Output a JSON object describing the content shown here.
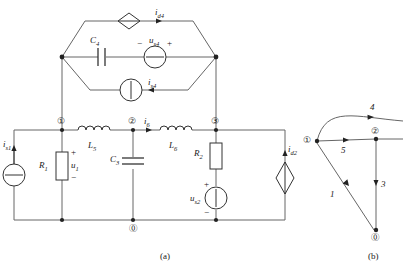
{
  "figure": {
    "captions": [
      {
        "id": "caption-a",
        "text": "(a)",
        "x": 160,
        "y": 252
      },
      {
        "id": "caption-b",
        "text": "(b)",
        "x": 368,
        "y": 252
      }
    ],
    "colors": {
      "wire": "#555555",
      "symbol": "#222222",
      "text": "#1a1a1a",
      "background": "#ffffff"
    }
  },
  "circuit": {
    "components": [
      {
        "name": "current-source-is1",
        "label": "i",
        "sub": "s1",
        "type": "independent-current-source",
        "symbol": "circle-horizontal-bar"
      },
      {
        "name": "resistor-r1",
        "label": "R",
        "sub": "1",
        "type": "resistor",
        "symbol": "rectangle"
      },
      {
        "name": "voltage-u1",
        "label": "u",
        "sub": "1",
        "type": "voltage-label",
        "plus": "+",
        "minus": "−"
      },
      {
        "name": "inductor-l5",
        "label": "L",
        "sub": "5",
        "type": "inductor",
        "symbol": "coil"
      },
      {
        "name": "capacitor-c3",
        "label": "C",
        "sub": "3",
        "type": "capacitor",
        "symbol": "parallel-plates"
      },
      {
        "name": "inductor-l6",
        "label": "L",
        "sub": "6",
        "type": "inductor",
        "symbol": "coil"
      },
      {
        "name": "current-i6",
        "label": "i",
        "sub": "6",
        "type": "branch-current",
        "direction": "right"
      },
      {
        "name": "resistor-r2",
        "label": "R",
        "sub": "2",
        "type": "resistor",
        "symbol": "rectangle"
      },
      {
        "name": "voltage-source-us2",
        "label": "u",
        "sub": "s2",
        "type": "independent-voltage-source",
        "symbol": "circle-vertical-bar",
        "plus": "+",
        "minus": "−"
      },
      {
        "name": "controlled-source-id2",
        "label": "i",
        "sub": "d2",
        "type": "controlled-current-source",
        "symbol": "diamond",
        "direction": "up"
      },
      {
        "name": "capacitor-c4",
        "label": "C",
        "sub": "4",
        "type": "capacitor",
        "symbol": "parallel-plates"
      },
      {
        "name": "voltage-source-us4",
        "label": "u",
        "sub": "s4",
        "type": "independent-voltage-source",
        "symbol": "circle-horizontal-bar",
        "plus": "+",
        "minus": "−"
      },
      {
        "name": "current-source-is4",
        "label": "i",
        "sub": "s4",
        "type": "independent-current-source",
        "symbol": "circle-vertical-bar",
        "direction": "left"
      },
      {
        "name": "controlled-source-id4",
        "label": "i",
        "sub": "d4",
        "type": "controlled-current-source",
        "symbol": "diamond",
        "direction": "right"
      }
    ],
    "nodes": [
      {
        "name": "node-1",
        "label": "①",
        "x": 62,
        "y": 122
      },
      {
        "name": "node-2",
        "label": "②",
        "x": 133,
        "y": 122
      },
      {
        "name": "node-3",
        "label": "③",
        "x": 216,
        "y": 122
      },
      {
        "name": "node-0",
        "label": "⓪",
        "x": 136,
        "y": 235
      }
    ]
  },
  "graph": {
    "nodes": [
      {
        "name": "graph-node-1",
        "label": "①",
        "x": 311,
        "y": 141
      },
      {
        "name": "graph-node-2",
        "label": "②",
        "x": 376,
        "y": 139
      },
      {
        "name": "graph-node-0",
        "label": "⓪",
        "x": 376,
        "y": 230
      }
    ],
    "branches": [
      {
        "name": "graph-branch-1",
        "label": "1"
      },
      {
        "name": "graph-branch-3",
        "label": "3"
      },
      {
        "name": "graph-branch-4",
        "label": "4"
      },
      {
        "name": "graph-branch-5",
        "label": "5"
      }
    ]
  }
}
